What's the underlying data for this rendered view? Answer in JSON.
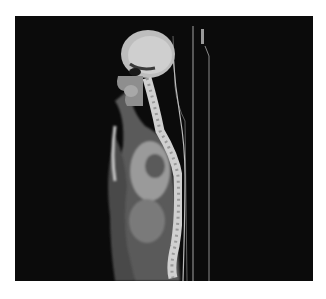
{
  "image": {
    "kind": "sagittal CT scan",
    "view": "sagittal",
    "subject": "whole-body (head, neck, thorax, lumbar spine)",
    "colors": {
      "page_background": "#ffffff",
      "panel_background": "#0b0b0b",
      "tissue": "#6f6f6f",
      "bone": "#d8d8d8",
      "brain": "#c8c8c8",
      "table_line": "#9a9a9a"
    }
  }
}
